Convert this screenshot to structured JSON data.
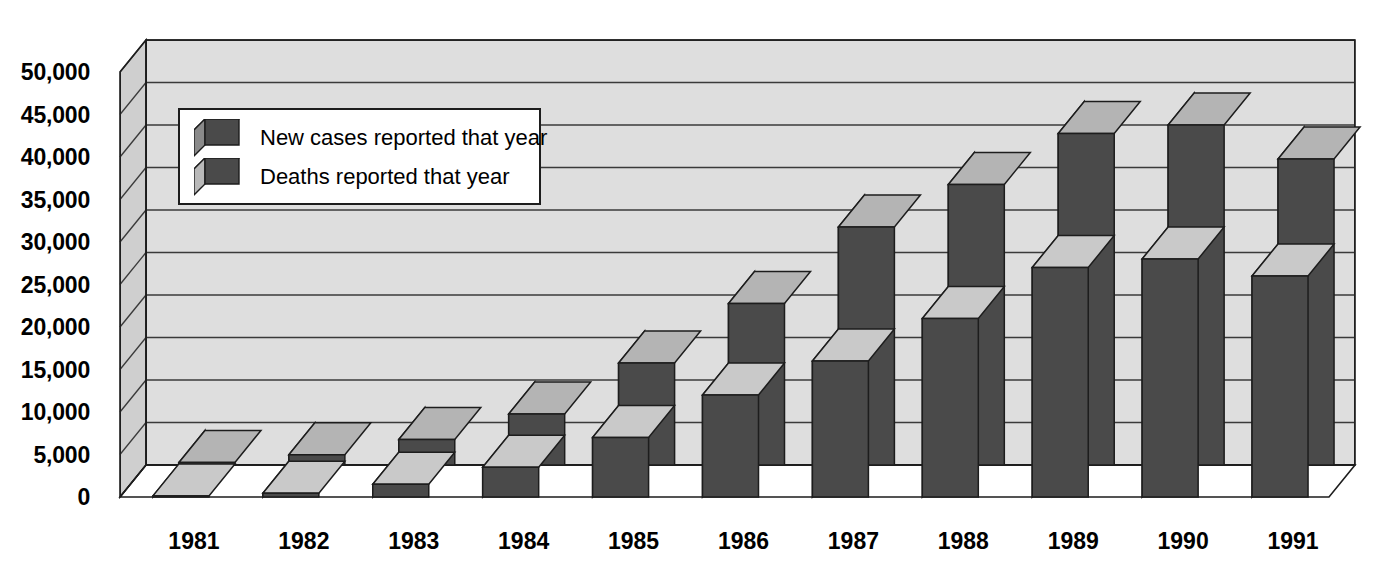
{
  "chart": {
    "type": "bar",
    "title": "",
    "style": "3d-clustered-column"
  },
  "legend": {
    "position": "inside-top-left",
    "items": [
      {
        "label": "New cases reported that year",
        "icon": "cube-icon",
        "color": "#4a4a4a"
      },
      {
        "label": "Deaths reported that year",
        "icon": "cube-icon",
        "color": "#b9b9b9"
      }
    ]
  },
  "yaxis": {
    "ticks": [
      "50,000",
      "45,000",
      "40,000",
      "35,000",
      "30,000",
      "25,000",
      "20,000",
      "15,000",
      "10,000",
      "5,000",
      "0"
    ],
    "min": 0,
    "max": 50000,
    "step": 5000,
    "label": ""
  },
  "xaxis": {
    "ticks": [
      "1981",
      "1982",
      "1983",
      "1984",
      "1985",
      "1986",
      "1987",
      "1988",
      "1989",
      "1990",
      "1991"
    ],
    "label": ""
  },
  "colors": {
    "new_cases_front": "#4a4a4a",
    "new_cases_top": "#b4b4b4",
    "new_cases_side": "#8a8a8a",
    "deaths_front": "#4a4a4a",
    "deaths_top": "#c9c9c9",
    "deaths_side": "#b9b9b9",
    "plot_background": "#dedede",
    "wall_left": "#cfcfcf",
    "gridline": "#3a3a3a",
    "outline": "#1d1d1d",
    "page_background": "#ffffff"
  },
  "chart_data": {
    "type": "bar",
    "title": "",
    "xlabel": "",
    "ylabel": "",
    "ylim": [
      0,
      50000
    ],
    "ystep": 5000,
    "grid": true,
    "legend_position": "inside-top-left",
    "categories": [
      "1981",
      "1982",
      "1983",
      "1984",
      "1985",
      "1986",
      "1987",
      "1988",
      "1989",
      "1990",
      "1991"
    ],
    "series": [
      {
        "name": "New cases reported that year",
        "values": [
          300,
          1200,
          3000,
          6000,
          12000,
          19000,
          28000,
          33000,
          39000,
          40000,
          36000
        ]
      },
      {
        "name": "Deaths reported that year",
        "values": [
          130,
          450,
          1500,
          3500,
          7000,
          12000,
          16000,
          21000,
          27000,
          28000,
          26000
        ]
      }
    ]
  }
}
